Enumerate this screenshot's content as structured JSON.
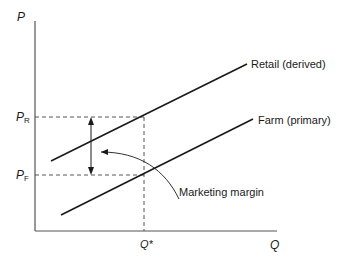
{
  "diagram": {
    "type": "supply-marketing-margin",
    "axes": {
      "y_label": "P",
      "x_label": "Q"
    },
    "price_levels": [
      {
        "id": "retail",
        "label": "P",
        "subscript": "R"
      },
      {
        "id": "farm",
        "label": "P",
        "subscript": "F"
      }
    ],
    "quantity_marker": {
      "label": "Q*"
    },
    "curves": [
      {
        "id": "retail",
        "label": "Retail (derived)"
      },
      {
        "id": "farm",
        "label": "Farm (primary)"
      }
    ],
    "annotation": {
      "label": "Marketing margin"
    },
    "colors": {
      "line": "#1a1a1a",
      "dashed": "#444444",
      "background": "#ffffff"
    }
  }
}
